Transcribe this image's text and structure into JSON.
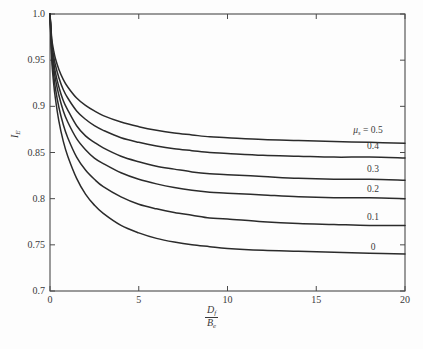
{
  "chart_data": {
    "type": "line",
    "title": "",
    "xlabel": "D_f / B_e",
    "ylabel": "I_E",
    "xlim": [
      0,
      20
    ],
    "ylim": [
      0.7,
      1.0
    ],
    "grid": false,
    "legend_position": "inline-right",
    "x_ticks": [
      "0",
      "5",
      "10",
      "15",
      "20"
    ],
    "x_tick_values": [
      0,
      5,
      10,
      15,
      20
    ],
    "y_ticks": [
      "0.7",
      "0.75",
      "0.8",
      "0.85",
      "0.9",
      "0.95",
      "1.0"
    ],
    "y_tick_values": [
      0.7,
      0.75,
      0.8,
      0.85,
      0.9,
      0.95,
      1.0
    ],
    "series_parameter_name": "mu_s",
    "series": [
      {
        "name": "0.5",
        "label": "0.5",
        "label_prefix": "μ",
        "label_sub": "s",
        "label_eq": " = ",
        "start_value": 1.0,
        "asymptote": 0.86,
        "x": [
          0,
          0.1,
          0.2,
          0.3,
          0.5,
          0.75,
          1,
          1.5,
          2,
          2.5,
          3,
          4,
          5,
          6,
          7,
          8,
          9,
          10,
          12,
          14,
          16,
          18,
          20
        ],
        "y": [
          1.0,
          0.973,
          0.961,
          0.952,
          0.94,
          0.929,
          0.921,
          0.909,
          0.901,
          0.895,
          0.89,
          0.883,
          0.878,
          0.874,
          0.871,
          0.869,
          0.867,
          0.866,
          0.864,
          0.863,
          0.862,
          0.861,
          0.86
        ]
      },
      {
        "name": "0.4",
        "label": "0.4",
        "start_value": 1.0,
        "asymptote": 0.844,
        "x": [
          0,
          0.1,
          0.2,
          0.3,
          0.5,
          0.75,
          1,
          1.5,
          2,
          2.5,
          3,
          4,
          5,
          6,
          7,
          8,
          9,
          10,
          12,
          14,
          16,
          18,
          20
        ],
        "y": [
          1.0,
          0.969,
          0.955,
          0.945,
          0.931,
          0.918,
          0.909,
          0.895,
          0.886,
          0.879,
          0.874,
          0.866,
          0.861,
          0.857,
          0.854,
          0.852,
          0.85,
          0.849,
          0.847,
          0.846,
          0.845,
          0.845,
          0.844
        ]
      },
      {
        "name": "0.3",
        "label": "0.3",
        "start_value": 1.0,
        "asymptote": 0.82,
        "x": [
          0,
          0.1,
          0.2,
          0.3,
          0.5,
          0.75,
          1,
          1.5,
          2,
          2.5,
          3,
          4,
          5,
          6,
          7,
          8,
          9,
          10,
          12,
          14,
          16,
          18,
          20
        ],
        "y": [
          1.0,
          0.965,
          0.949,
          0.937,
          0.921,
          0.906,
          0.896,
          0.879,
          0.868,
          0.861,
          0.855,
          0.846,
          0.84,
          0.835,
          0.832,
          0.829,
          0.827,
          0.826,
          0.824,
          0.822,
          0.821,
          0.821,
          0.82
        ]
      },
      {
        "name": "0.2",
        "label": "0.2",
        "start_value": 1.0,
        "asymptote": 0.8,
        "x": [
          0,
          0.1,
          0.2,
          0.3,
          0.5,
          0.75,
          1,
          1.5,
          2,
          2.5,
          3,
          4,
          5,
          6,
          7,
          8,
          9,
          10,
          12,
          14,
          16,
          18,
          20
        ],
        "y": [
          1.0,
          0.961,
          0.943,
          0.93,
          0.912,
          0.895,
          0.883,
          0.865,
          0.853,
          0.844,
          0.838,
          0.828,
          0.821,
          0.816,
          0.812,
          0.809,
          0.807,
          0.806,
          0.804,
          0.802,
          0.801,
          0.801,
          0.8
        ]
      },
      {
        "name": "0.1",
        "label": "0.1",
        "start_value": 1.0,
        "asymptote": 0.771,
        "x": [
          0,
          0.1,
          0.2,
          0.3,
          0.5,
          0.75,
          1,
          1.5,
          2,
          2.5,
          3,
          4,
          5,
          6,
          7,
          8,
          9,
          10,
          12,
          14,
          16,
          18,
          20
        ],
        "y": [
          1.0,
          0.956,
          0.935,
          0.92,
          0.899,
          0.88,
          0.866,
          0.845,
          0.831,
          0.821,
          0.813,
          0.802,
          0.794,
          0.789,
          0.785,
          0.782,
          0.779,
          0.778,
          0.775,
          0.773,
          0.772,
          0.771,
          0.771
        ]
      },
      {
        "name": "0",
        "label": "0",
        "start_value": 1.0,
        "asymptote": 0.74,
        "x": [
          0,
          0.1,
          0.2,
          0.3,
          0.5,
          0.75,
          1,
          1.5,
          2,
          2.5,
          3,
          4,
          5,
          6,
          7,
          8,
          9,
          10,
          12,
          14,
          16,
          18,
          20
        ],
        "y": [
          1.0,
          0.95,
          0.926,
          0.909,
          0.884,
          0.862,
          0.846,
          0.822,
          0.805,
          0.793,
          0.784,
          0.771,
          0.763,
          0.757,
          0.753,
          0.75,
          0.748,
          0.746,
          0.744,
          0.743,
          0.742,
          0.741,
          0.74
        ]
      }
    ],
    "series_label_positions": [
      {
        "name": "0.5",
        "x_px": 368,
        "y_px": 131
      },
      {
        "name": "0.4",
        "x_px": 373,
        "y_px": 147
      },
      {
        "name": "0.3",
        "x_px": 373,
        "y_px": 170
      },
      {
        "name": "0.2",
        "x_px": 373,
        "y_px": 190
      },
      {
        "name": "0.1",
        "x_px": 373,
        "y_px": 218
      },
      {
        "name": "0",
        "x_px": 373,
        "y_px": 248
      }
    ],
    "axis_color": "#4a4a4a",
    "line_color": "#2b2b2b",
    "background_color": "#fdfdfd"
  },
  "axis_labels": {
    "y": {
      "symbol": "I",
      "sub": "E"
    },
    "x": {
      "numerator_symbol": "D",
      "numerator_sub": "f",
      "denominator_symbol": "B",
      "denominator_sub": "e"
    }
  }
}
